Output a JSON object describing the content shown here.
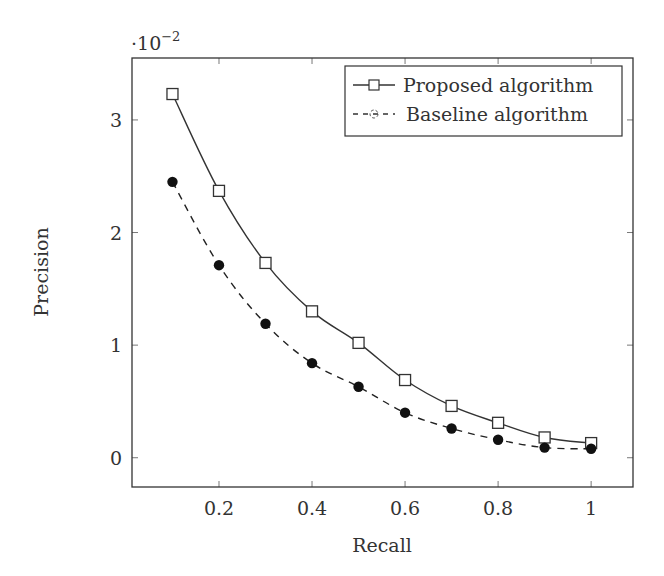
{
  "chart_data": {
    "type": "line",
    "title": "",
    "xlabel": "Recall",
    "ylabel": "Precision",
    "y_scale_note": "·10^-2",
    "y_scale_base": "·10",
    "y_scale_exponent": "−2",
    "xlim": [
      0.013,
      1.09
    ],
    "ylim": [
      -0.26,
      3.55
    ],
    "xticks": [
      0.2,
      0.4,
      0.6,
      0.8,
      1
    ],
    "xtick_labels": [
      "0.2",
      "0.4",
      "0.6",
      "0.8",
      "1"
    ],
    "yticks": [
      0,
      1,
      2,
      3
    ],
    "ytick_labels": [
      "0",
      "1",
      "2",
      "3"
    ],
    "grid": false,
    "legend_position": "upper right",
    "x": [
      0.1,
      0.2,
      0.3,
      0.4,
      0.5,
      0.6,
      0.7,
      0.8,
      0.9,
      1.0
    ],
    "series": [
      {
        "name": "Proposed algorithm",
        "marker": "open-square",
        "line_style": "solid",
        "color": "#333333",
        "values": [
          3.23,
          2.37,
          1.73,
          1.3,
          1.02,
          0.69,
          0.46,
          0.31,
          0.18,
          0.13
        ]
      },
      {
        "name": "Baseline algorithm",
        "marker": "filled-circle",
        "line_style": "dashed",
        "color": "#222222",
        "values": [
          2.45,
          1.71,
          1.19,
          0.84,
          0.63,
          0.4,
          0.26,
          0.16,
          0.09,
          0.08
        ]
      }
    ]
  },
  "legend": {
    "items": [
      {
        "label": "Proposed algorithm"
      },
      {
        "label": "Baseline algorithm"
      }
    ]
  }
}
